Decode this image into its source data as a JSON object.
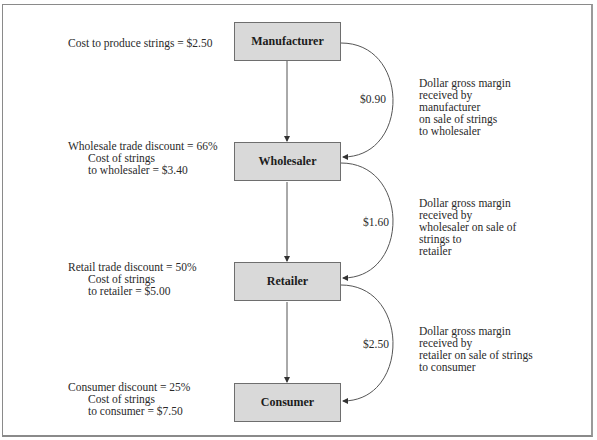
{
  "nodes": [
    {
      "label": "Manufacturer"
    },
    {
      "label": "Wholesaler"
    },
    {
      "label": "Retailer"
    },
    {
      "label": "Consumer"
    }
  ],
  "left_notes": [
    {
      "line1": "Cost to produce strings = $2.50"
    },
    {
      "line1": "Wholesale trade discount = 66%",
      "line2": "Cost of strings",
      "line3": "to wholesaler = $3.40"
    },
    {
      "line1": "Retail trade discount = 50%",
      "line2": "Cost of strings",
      "line3": "to retailer = $5.00"
    },
    {
      "line1": "Consumer discount = 25%",
      "line2": "Cost of strings",
      "line3": "to consumer = $7.50"
    }
  ],
  "margins": [
    {
      "amount": "$0.90",
      "lines": [
        "Dollar gross margin",
        "received by",
        "manufacturer",
        "on sale of strings",
        "to wholesaler"
      ]
    },
    {
      "amount": "$1.60",
      "lines": [
        "Dollar gross margin",
        "received by",
        "wholesaler on sale of",
        "strings to",
        "retailer"
      ]
    },
    {
      "amount": "$2.50",
      "lines": [
        "Dollar gross margin",
        "received by",
        "retailer on sale of strings",
        "to consumer"
      ]
    }
  ],
  "colors": {
    "node_fill": "#d9d9d9",
    "node_border": "#6e6e6e",
    "line": "#555555"
  }
}
